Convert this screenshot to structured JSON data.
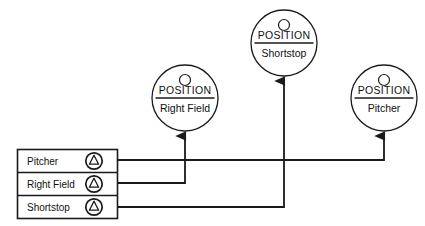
{
  "diagram": {
    "kind_label": "POSITION",
    "nodes": [
      {
        "id": "right-field",
        "kind": "POSITION",
        "name": "Right Field",
        "cx": 185,
        "cy": 98,
        "r": 33
      },
      {
        "id": "shortstop",
        "kind": "POSITION",
        "name": "Shortstop",
        "cx": 284,
        "cy": 43,
        "r": 33
      },
      {
        "id": "pitcher",
        "kind": "POSITION",
        "name": "Pitcher",
        "cx": 384,
        "cy": 98,
        "r": 33
      }
    ],
    "list": {
      "rows": [
        {
          "label": "Pitcher",
          "icon": "position-marker-icon",
          "target": "pitcher"
        },
        {
          "label": "Right Field",
          "icon": "position-marker-icon",
          "target": "right-field"
        },
        {
          "label": "Shortstop",
          "icon": "position-marker-icon",
          "target": "shortstop"
        }
      ]
    },
    "connectors": [
      {
        "from": "Pitcher",
        "to": "pitcher",
        "path": "M118,160 L384,160 L384,133"
      },
      {
        "from": "Right Field",
        "to": "right-field",
        "path": "M118,183 L185,183 L185,133"
      },
      {
        "from": "Shortstop",
        "to": "shortstop",
        "path": "M118,207 L284,207 L284,78"
      }
    ],
    "colors": {
      "stroke": "#1a1a1a",
      "background": "#ffffff",
      "text": "#111111"
    }
  }
}
